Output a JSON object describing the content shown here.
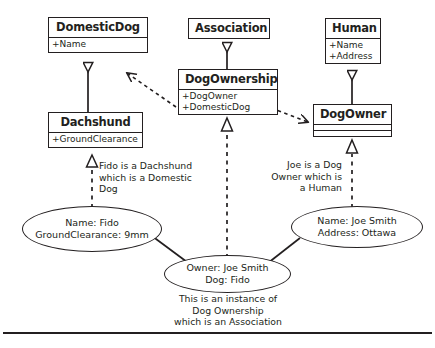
{
  "diagram": {
    "stroke_color": "#231f20",
    "background_color": "#ffffff",
    "classes": [
      {
        "id": "domesticdog",
        "name": "DomesticDog",
        "attributes": [
          "+Name"
        ]
      },
      {
        "id": "association",
        "name": "Association",
        "attributes": []
      },
      {
        "id": "human",
        "name": "Human",
        "attributes": [
          "+Name",
          "+Address"
        ]
      },
      {
        "id": "dogownership",
        "name": "DogOwnership",
        "attributes": [
          "+DogOwner",
          "+DomesticDog"
        ]
      },
      {
        "id": "dogowner",
        "name": "DogOwner",
        "attributes": []
      },
      {
        "id": "dachshund",
        "name": "Dachshund",
        "attributes": [
          "+GroundClearance"
        ]
      }
    ],
    "instances": [
      {
        "id": "fido",
        "lines": [
          "Name: Fido",
          "GroundClearance: 9mm"
        ]
      },
      {
        "id": "joesmith",
        "lines": [
          "Name: Joe Smith",
          "Address: Ottawa"
        ]
      },
      {
        "id": "ownership",
        "lines": [
          "Owner: Joe Smith",
          "Dog: Fido"
        ]
      }
    ],
    "annotations": [
      {
        "id": "fido-note",
        "lines": [
          "Fido is a Dachshund",
          "which is a Domestic",
          "Dog"
        ]
      },
      {
        "id": "joe-note",
        "lines": [
          "Joe is a Dog",
          "Owner which is",
          "a Human"
        ]
      },
      {
        "id": "ownership-note",
        "lines": [
          "This is an instance of",
          "Dog Ownership",
          "which is an Association"
        ]
      }
    ]
  }
}
